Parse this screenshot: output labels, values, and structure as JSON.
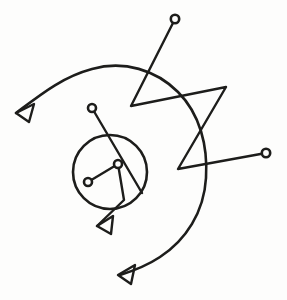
{
  "canvas": {
    "width": 287,
    "height": 300,
    "background_color": "#fdfdfc",
    "ink_color": "#1d1d1b",
    "title": "hand-drawn line sketch"
  },
  "shapes": {
    "big_arc": {
      "name": "large-spiral-arc",
      "path": "M 16 113 C 40 95 62 77 92 69 C 124 60 156 70 178 92 C 200 114 208 146 206 178 C 204 212 186 240 160 257 C 148 265 136 270 120 275",
      "stroke_width": 2.6
    },
    "circle": {
      "name": "medium-circle",
      "cx": 110,
      "cy": 172,
      "r": 37,
      "stroke_width": 2.6
    },
    "zigzag": {
      "name": "zigzag-polyline",
      "points": "175 19 131 106 226 87 178 169 266 153",
      "stroke_width": 2.4
    },
    "inner_vee": {
      "name": "inner-vee-polyline",
      "points": "88 182 118 164 124 200 97 226",
      "stroke_width": 2.4
    },
    "diagonal_stem": {
      "name": "diagonal-stem-line",
      "path": "M 92 108 L 142 193",
      "stroke_width": 2.4
    }
  },
  "endpoints": {
    "circle_nodes": [
      {
        "name": "node-top-right",
        "cx": 175,
        "cy": 19,
        "r": 4.2
      },
      {
        "name": "node-right",
        "cx": 266,
        "cy": 153,
        "r": 4.2
      },
      {
        "name": "node-upper-left-stem",
        "cx": 92,
        "cy": 108,
        "r": 4.0
      },
      {
        "name": "node-inner-apex",
        "cx": 118,
        "cy": 164,
        "r": 4.0
      },
      {
        "name": "node-inner-left",
        "cx": 88,
        "cy": 182,
        "r": 4.0
      }
    ],
    "arrow_heads": [
      {
        "name": "arrowhead-left",
        "points": "16 113 34 104 29 122 16 113",
        "tip_x": 16,
        "tip_y": 113
      },
      {
        "name": "arrowhead-lower-middle",
        "points": "97 226 113 216 111 234 97 226",
        "tip_x": 97,
        "tip_y": 226
      },
      {
        "name": "arrowhead-bottom",
        "points": "118 275 135 265 131 284 118 275",
        "tip_x": 118,
        "tip_y": 275
      }
    ]
  },
  "counts": {
    "arrowheads": 3,
    "circle_nodes": 5,
    "closed_circles": 1,
    "polylines": 2,
    "arcs": 1
  }
}
